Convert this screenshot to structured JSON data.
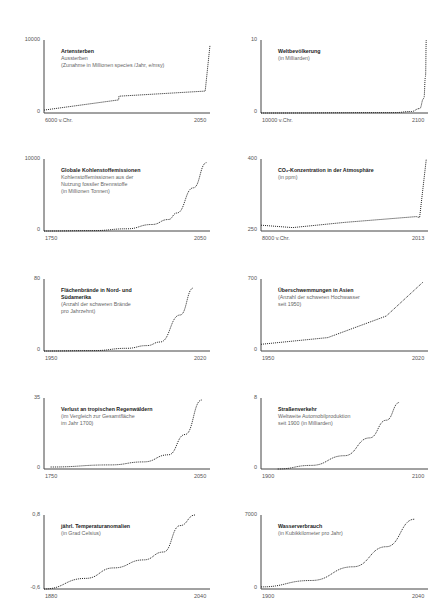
{
  "chart_data": [
    {
      "type": "line",
      "title": "Artensterben",
      "subtitle": [
        "Aussterben",
        "(Zunahme in Millionen species /Jahr, e/msy)"
      ],
      "xlabel": "",
      "ylabel": "",
      "x_ticks": [
        "6000 v.Chr.",
        "2050"
      ],
      "y_ticks": [
        "0",
        "10000"
      ],
      "ylim": [
        0,
        10000
      ],
      "x": [
        0,
        0.45,
        0.451,
        0.97,
        0.971,
        1.0
      ],
      "values": [
        400,
        1800,
        2300,
        3000,
        3000,
        9300
      ],
      "shape": "step-then-vertical"
    },
    {
      "type": "line",
      "title": "Weltbevölkerung",
      "subtitle": [
        "(in Milliarden)"
      ],
      "x_ticks": [
        "10000 v.Chr.",
        "2100"
      ],
      "y_ticks": [
        "0",
        "10"
      ],
      "ylim": [
        0,
        10
      ],
      "x": [
        0,
        0.8,
        0.9,
        0.95,
        0.975,
        0.985,
        0.99
      ],
      "values": [
        0,
        0.05,
        0.2,
        0.6,
        2,
        5,
        10
      ],
      "shape": "exponential"
    },
    {
      "type": "line",
      "title": "Globale Kohlenstoffemissionen",
      "subtitle": [
        "Kohlenstoffemissionen aus der",
        "Nutzung fossiler Brennstoffe",
        "(in Millionen Tonnen)"
      ],
      "x_ticks": [
        "1750",
        "2050"
      ],
      "y_ticks": [
        "0",
        "10000"
      ],
      "ylim": [
        0,
        10000
      ],
      "x": [
        0,
        0.3,
        0.5,
        0.65,
        0.75,
        0.8,
        0.9,
        0.98
      ],
      "values": [
        0,
        50,
        300,
        900,
        1600,
        2500,
        6000,
        9500
      ],
      "shape": "exponential"
    },
    {
      "type": "line",
      "title": "CO₂-Konzentration in der Atmosphäre",
      "subtitle": [
        "(in ppm)"
      ],
      "x_ticks": [
        "8000 v.Chr.",
        "2013"
      ],
      "y_ticks": [
        "250",
        "400"
      ],
      "ylim": [
        250,
        400
      ],
      "x": [
        0,
        0.19,
        0.5,
        0.93,
        0.95,
        0.99
      ],
      "values": [
        262,
        257,
        268,
        280,
        278,
        400
      ],
      "shape": "slow-then-vertical"
    },
    {
      "type": "line",
      "title": "Flächenbrände in Nord- und Südamerika",
      "subtitle": [
        "(Anzahl der schweren Brände",
        "pro Jahrzehnt)"
      ],
      "x_ticks": [
        "1950",
        "2020"
      ],
      "y_ticks": [
        "0",
        "80"
      ],
      "ylim": [
        0,
        80
      ],
      "x": [
        0,
        0.3,
        0.5,
        0.62,
        0.7,
        0.82,
        0.9
      ],
      "values": [
        0,
        0.5,
        3,
        6,
        10,
        40,
        70
      ],
      "shape": "exponential"
    },
    {
      "type": "line",
      "title": "Überschwemmungen in Asien",
      "subtitle": [
        "(Anzahl der schweren Hochwasser",
        "seit 1950)"
      ],
      "x_ticks": [
        "1950",
        "2020"
      ],
      "y_ticks": [
        "0",
        "700"
      ],
      "ylim": [
        0,
        700
      ],
      "x": [
        0,
        0.4,
        0.75,
        0.97
      ],
      "values": [
        65,
        130,
        340,
        670
      ],
      "shape": "piecewise-linear"
    },
    {
      "type": "line",
      "title": "Verlust an tropischen Regenwäldern",
      "subtitle": [
        "(im Vergleich zur Gesamtfläche",
        "im Jahr 1700)"
      ],
      "x_ticks": [
        "1750",
        "2050"
      ],
      "y_ticks": [
        "0",
        "35"
      ],
      "ylim": [
        0,
        35
      ],
      "x": [
        0.04,
        0.4,
        0.6,
        0.75,
        0.85,
        0.95
      ],
      "values": [
        1,
        2,
        3.5,
        7,
        17,
        34
      ],
      "shape": "exponential"
    },
    {
      "type": "line",
      "title": "Straßenverkehr",
      "subtitle": [
        "Weltweite Automobilproduktion",
        "seit 1900 (in Milliarden)"
      ],
      "x_ticks": [
        "1900",
        "2100"
      ],
      "y_ticks": [
        "0",
        "8"
      ],
      "ylim": [
        0,
        8
      ],
      "x": [
        0.1,
        0.3,
        0.5,
        0.65,
        0.75,
        0.83
      ],
      "values": [
        0,
        0.4,
        1.5,
        3.5,
        5.5,
        7.5
      ],
      "shape": "exponential"
    },
    {
      "type": "line",
      "title": "jährl. Temperaturanomalien",
      "subtitle": [
        "(in Grad Celsius)"
      ],
      "x_ticks": [
        "1880",
        "2040"
      ],
      "y_ticks": [
        "-0,6",
        "0,8"
      ],
      "ylim": [
        -0.6,
        0.8
      ],
      "x": [
        0,
        0.25,
        0.42,
        0.6,
        0.72,
        0.82,
        0.91
      ],
      "values": [
        -0.6,
        -0.4,
        -0.2,
        -0.05,
        0.1,
        0.6,
        0.8
      ],
      "shape": "s-curve"
    },
    {
      "type": "line",
      "title": "Wasserverbrauch",
      "subtitle": [
        "(in Kubikkilometer pro Jahr)"
      ],
      "x_ticks": [
        "1900",
        "2040"
      ],
      "y_ticks": [
        "0",
        "7000"
      ],
      "ylim": [
        0,
        7000
      ],
      "x": [
        0,
        0.3,
        0.55,
        0.75,
        0.92
      ],
      "values": [
        200,
        800,
        2100,
        4000,
        6600
      ],
      "shape": "exponential"
    }
  ]
}
